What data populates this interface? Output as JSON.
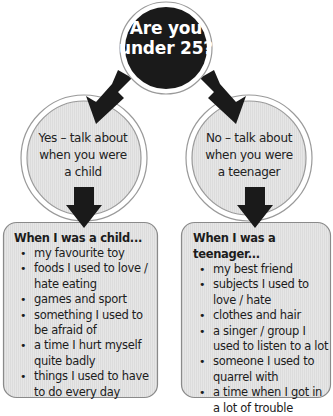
{
  "question": {
    "line1": "Are you",
    "line2": "under 25?"
  },
  "branches": [
    {
      "id": "yes",
      "lines": [
        "Yes – talk about",
        "when you were",
        "a child"
      ],
      "box_title": "When I was a child...",
      "items": [
        "my favourite toy",
        "foods I used to love / hate eating",
        "games and sport",
        "something I used to be afraid of",
        "a time I hurt myself quite badly",
        "things I used to have to do every day"
      ]
    },
    {
      "id": "no",
      "lines": [
        "No – talk about",
        "when you were",
        "a teenager"
      ],
      "box_title": "When I was a teenager...",
      "items": [
        "my best friend",
        "subjects I used to love / hate",
        "clothes and hair",
        "a singer / group I used to listen to a lot",
        "someone I used to quarrel with",
        "a time when I got in a lot of trouble"
      ]
    }
  ],
  "colors": {
    "question_fill": "#1a1a1a",
    "circle_fill": "#e2e2e2",
    "box_fill": "#e4e4e4",
    "border": "#8a8a8a",
    "arrow": "#1a1a1a"
  }
}
